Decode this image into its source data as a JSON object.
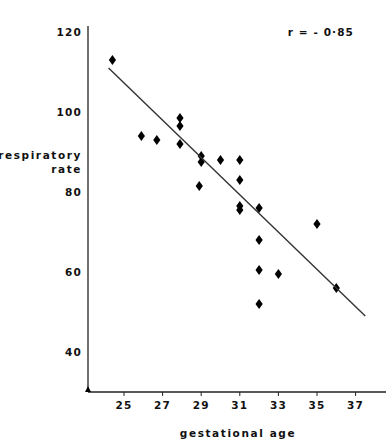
{
  "chart_data": {
    "type": "scatter",
    "title": "",
    "xlabel": "gestational age",
    "ylabel": "respiratory rate",
    "ylabel_lines": [
      "respiratory",
      "rate"
    ],
    "xlim": [
      23.6,
      37.8
    ],
    "ylim": [
      32,
      122
    ],
    "xticks": [
      25,
      27,
      29,
      31,
      33,
      35,
      37
    ],
    "yticks": [
      40,
      60,
      80,
      100,
      120
    ],
    "xtick_labels": [
      "25",
      "27",
      "29",
      "31",
      "33",
      "35",
      "37"
    ],
    "ytick_labels": [
      "40",
      "60",
      "80",
      "100",
      "120"
    ],
    "grid": false,
    "legend": null,
    "annotations": [
      {
        "name": "correlation",
        "text": "r = - 0·85",
        "x": 35.2,
        "y": 119
      }
    ],
    "marker": {
      "shape": "diamond",
      "color": "#000000",
      "size": 5
    },
    "points": [
      {
        "x": 24.4,
        "y": 113
      },
      {
        "x": 25.9,
        "y": 94
      },
      {
        "x": 26.7,
        "y": 93
      },
      {
        "x": 27.9,
        "y": 98.5
      },
      {
        "x": 27.9,
        "y": 96.5
      },
      {
        "x": 27.9,
        "y": 92
      },
      {
        "x": 29.0,
        "y": 89
      },
      {
        "x": 29.0,
        "y": 87.5
      },
      {
        "x": 28.9,
        "y": 81.5
      },
      {
        "x": 30.0,
        "y": 88
      },
      {
        "x": 31.0,
        "y": 88
      },
      {
        "x": 31.0,
        "y": 83
      },
      {
        "x": 31.0,
        "y": 76.5
      },
      {
        "x": 31.0,
        "y": 75.5
      },
      {
        "x": 32.0,
        "y": 76
      },
      {
        "x": 32.0,
        "y": 68
      },
      {
        "x": 32.0,
        "y": 60.5
      },
      {
        "x": 32.0,
        "y": 52
      },
      {
        "x": 33.0,
        "y": 59.5
      },
      {
        "x": 35.0,
        "y": 72
      },
      {
        "x": 36.0,
        "y": 56
      }
    ],
    "trendline": {
      "type": "linear-fit",
      "x_start": 24.2,
      "y_start": 111,
      "x_end": 37.5,
      "y_end": 49,
      "color": "#333333",
      "width": 1.4
    }
  }
}
